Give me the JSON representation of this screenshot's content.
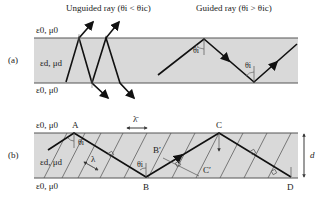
{
  "colors": {
    "slab": "#d9d9d9",
    "boundary": "#555555",
    "ray": "#111111",
    "wavefront": "#777777"
  },
  "panel_a": {
    "label": "(a)",
    "unguided_title": "Unguided ray (θi < θic)",
    "guided_title": "Guided ray (θi > θic)",
    "top_medium": "ε0, μ0",
    "core_medium": "εd, μd",
    "bottom_medium": "ε0, μ0",
    "angle1": "θi",
    "angle2": "θi"
  },
  "panel_b": {
    "label": "(b)",
    "top_medium": "ε0, μ0",
    "core_medium": "εd, μd",
    "bottom_medium": "ε0, μ0",
    "points": {
      "A": "A",
      "B": "B",
      "C": "C",
      "D": "D",
      "Bp": "B′",
      "Cp": "C′"
    },
    "lambda_bar": "λ̄",
    "lambda": "λ",
    "angle1": "θi",
    "angle2": "θi",
    "thickness": "d"
  }
}
